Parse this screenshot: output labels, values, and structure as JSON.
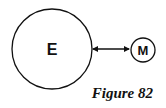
{
  "diagram": {
    "nodes": [
      {
        "id": "earth",
        "label": "E",
        "size": "large"
      },
      {
        "id": "moon",
        "label": "M",
        "size": "small"
      }
    ],
    "edges": [
      {
        "from": "earth",
        "to": "moon",
        "style": "double-headed-arrow"
      }
    ],
    "caption": "Figure 82"
  }
}
